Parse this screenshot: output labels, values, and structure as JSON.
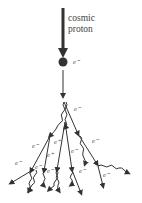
{
  "diagram": {
    "title_line1": "cosmic",
    "title_line2": "proton",
    "primary_label": "e⁻",
    "labels": [
      {
        "text": "e⁻",
        "x": 74,
        "y": 106
      },
      {
        "text": "e⁻",
        "x": 32,
        "y": 143
      },
      {
        "text": "e⁺",
        "x": 54,
        "y": 139
      },
      {
        "text": "e⁻",
        "x": 92,
        "y": 138
      },
      {
        "text": "e⁺",
        "x": 47,
        "y": 152
      },
      {
        "text": "e⁻",
        "x": 71,
        "y": 148
      },
      {
        "text": "e⁻",
        "x": 15,
        "y": 160
      },
      {
        "text": "e⁻",
        "x": 35,
        "y": 164
      },
      {
        "text": "e⁻",
        "x": 47,
        "y": 168
      },
      {
        "text": "e⁻",
        "x": 79,
        "y": 168
      },
      {
        "text": "e⁻",
        "x": 103,
        "y": 172
      }
    ],
    "colors": {
      "ink": "#333333",
      "background": "#ffffff"
    }
  }
}
